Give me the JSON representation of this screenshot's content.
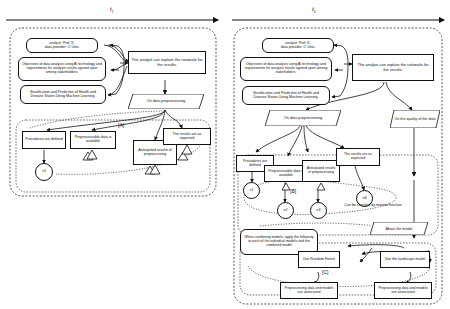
{
  "figure": {
    "type": "gsn-assurance-case-evolution",
    "timeline": {
      "axis_label": "time",
      "ticks": [
        {
          "id": "t1",
          "label": "t",
          "sub": "1"
        },
        {
          "id": "t2",
          "label": "t",
          "sub": "2"
        }
      ]
    }
  },
  "panels": [
    {
      "id": "panel-t1",
      "time_label": "t1",
      "nodes": [
        {
          "id": "c1",
          "kind": "context-rounded",
          "text": "analyst: Prof. K.\ndata provider: O Univ."
        },
        {
          "id": "c2",
          "kind": "context-rounded",
          "text": "Objectives of data analysis using AI technology and requirements for analysis results agreed upon among stakeholders."
        },
        {
          "id": "c3",
          "kind": "context-rounded",
          "text": "Stratification and Prediction of Health and Disease States Using Machine Learning."
        },
        {
          "id": "g1",
          "kind": "goal",
          "text": "The analyst can explain the rationale for the results."
        },
        {
          "id": "s1",
          "kind": "strategy-parallelogram",
          "text": "On data preprocessing"
        },
        {
          "id": "g2",
          "kind": "goal",
          "text": "Procedures are defined"
        },
        {
          "id": "g3",
          "kind": "goal",
          "text": "Preprocessable data is available"
        },
        {
          "id": "g4",
          "kind": "goal",
          "text": "Anticipated results of preprocessing"
        },
        {
          "id": "g5",
          "kind": "goal",
          "text": "The results are as expected"
        },
        {
          "id": "e1",
          "kind": "evidence-circle",
          "text": "e1"
        }
      ],
      "annotations": [
        {
          "id": "ann-a",
          "text": "[A]"
        }
      ]
    },
    {
      "id": "panel-t2",
      "time_label": "t2",
      "nodes": [
        {
          "id": "c1b",
          "kind": "context-rounded",
          "text": "analyst: Prof. K.\ndata provider: O Univ."
        },
        {
          "id": "c2b",
          "kind": "context-rounded",
          "text": "Objectives of data analysis using AI technology and requirements for analysis results agreed upon among stakeholders."
        },
        {
          "id": "c3b",
          "kind": "context-rounded",
          "text": "Stratification and Prediction of Health and Disease States Using Machine Learning."
        },
        {
          "id": "g1b",
          "kind": "goal",
          "text": "The analyst can explain the rationale for the results."
        },
        {
          "id": "s1b",
          "kind": "strategy-parallelogram",
          "text": "On data preprocessing"
        },
        {
          "id": "s2b",
          "kind": "strategy-parallelogram",
          "text": "On the quality of the data"
        },
        {
          "id": "g2b",
          "kind": "goal",
          "text": "Procedures are defined"
        },
        {
          "id": "g3b",
          "kind": "goal",
          "text": "Preprocessable data is available"
        },
        {
          "id": "g4b",
          "kind": "goal",
          "text": "Anticipated results of preprocessing"
        },
        {
          "id": "g5b",
          "kind": "goal",
          "text": "The results are as expected"
        },
        {
          "id": "e1b",
          "kind": "evidence-circle",
          "text": "e1"
        },
        {
          "id": "e2b",
          "kind": "evidence-circle",
          "text": "e2"
        },
        {
          "id": "e3b",
          "kind": "evidence-circle",
          "text": "e3"
        },
        {
          "id": "e4b",
          "kind": "evidence-circle",
          "text": "e4"
        },
        {
          "id": "n-mon",
          "kind": "note",
          "text": "Can be checked by monitor function"
        },
        {
          "id": "s3b",
          "kind": "strategy-parallelogram",
          "text": "About the model"
        },
        {
          "id": "c4b",
          "kind": "context-rounded",
          "text": "When combining models, apply the following to each of the individual models and the combined model"
        },
        {
          "id": "g6b",
          "kind": "goal",
          "text": "Use Random Forest"
        },
        {
          "id": "g7b",
          "kind": "goal",
          "text": "Use the landscape model"
        },
        {
          "id": "g8b",
          "kind": "goal",
          "text": "Preprocessing data and models are associated"
        },
        {
          "id": "g9b",
          "kind": "goal",
          "text": "Preprocessing data and models are associated"
        }
      ],
      "annotations": [
        {
          "id": "ann-b",
          "text": "[B]"
        },
        {
          "id": "ann-c",
          "text": "[C]"
        }
      ]
    }
  ]
}
